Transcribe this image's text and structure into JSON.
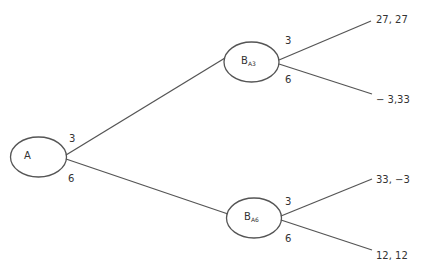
{
  "diagram": {
    "type": "game-tree",
    "stroke_color": "#555555",
    "nodes": {
      "root": {
        "label": "A"
      },
      "upper": {
        "label": "B",
        "subscript": "A3"
      },
      "lower": {
        "label": "B",
        "subscript": "A6"
      }
    },
    "edges": {
      "root_upper": "3",
      "root_lower": "6",
      "upper_top": "3",
      "upper_bottom": "6",
      "lower_top": "3",
      "lower_bottom": "6"
    },
    "payoffs": {
      "p1": "27, 27",
      "p2": "− 3,33",
      "p3": "33, −3",
      "p4": "12, 12"
    }
  }
}
